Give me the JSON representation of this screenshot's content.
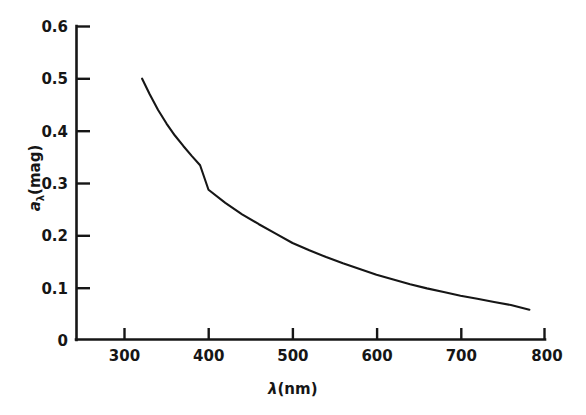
{
  "chart_data": {
    "type": "line",
    "title": "",
    "xlabel": "λ(nm)",
    "ylabel": "aλ(mag)",
    "ylabel_main": "a",
    "ylabel_sub": "λ",
    "ylabel_rest": "(mag)",
    "xlabel_symbol": "λ",
    "xlabel_unit": "(nm)",
    "xlim": [
      250,
      800
    ],
    "ylim": [
      0,
      0.6
    ],
    "grid": false,
    "legend": null,
    "x_ticks": [
      300,
      400,
      500,
      600,
      700,
      800
    ],
    "x_tick_labels": [
      "300",
      "400",
      "500",
      "600",
      "700",
      "800"
    ],
    "y_ticks": [
      0,
      0.1,
      0.2,
      0.3,
      0.4,
      0.5,
      0.6
    ],
    "y_tick_labels": [
      "0",
      "0.1",
      "0.2",
      "0.3",
      "0.4",
      "0.5",
      "0.6"
    ],
    "line_color": "#161616",
    "series": [
      {
        "name": "atmospheric extinction",
        "x": [
          321,
          330,
          340,
          350,
          360,
          370,
          380,
          390,
          400,
          420,
          440,
          460,
          480,
          500,
          520,
          540,
          560,
          580,
          600,
          620,
          640,
          660,
          680,
          700,
          720,
          740,
          760,
          782
        ],
        "values": [
          0.5,
          0.47,
          0.44,
          0.414,
          0.391,
          0.371,
          0.352,
          0.334,
          0.287,
          0.262,
          0.24,
          0.221,
          0.203,
          0.185,
          0.171,
          0.158,
          0.146,
          0.135,
          0.124,
          0.115,
          0.106,
          0.098,
          0.091,
          0.084,
          0.078,
          0.072,
          0.066,
          0.057
        ]
      }
    ]
  },
  "figure": {
    "caption": ""
  }
}
